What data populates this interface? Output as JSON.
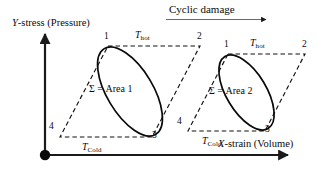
{
  "figure": {
    "title": "Cyclic damage",
    "title_arrow": "rightwards-arrow",
    "axes": {
      "y_label_symbol": "Y",
      "y_label_text": "-stress (Pressure)",
      "y_label_full": "Y-stress (Pressure)",
      "x_label_symbol": "X",
      "x_label_text": "-strain (Volume)",
      "x_label_full": "X-strain (Volume)",
      "origin_marker": "filled-dot"
    },
    "cycles": [
      {
        "id": "cycle-1",
        "area_text": "Σ = Area 1",
        "area_symbol": "Σ",
        "hot_symbol": "T",
        "hot_subscript": "hot",
        "cold_symbol": "T",
        "cold_subscript": "Cold",
        "corners": [
          "1",
          "2",
          "3",
          "4"
        ]
      },
      {
        "id": "cycle-2",
        "area_text": "Σ = Area 2",
        "area_symbol": "Σ",
        "hot_symbol": "T",
        "hot_subscript": "hot",
        "cold_symbol": "T",
        "cold_subscript": "Cold",
        "corners": [
          "1",
          "2",
          "3",
          "4"
        ]
      }
    ],
    "colors": {
      "ink": "#0a0a0a",
      "axis": "#1a1a1a",
      "dashed": "#111111",
      "background": "#ffffff"
    }
  }
}
